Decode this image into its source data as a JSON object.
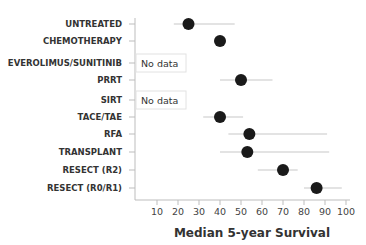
{
  "chart_data": {
    "type": "scatter",
    "subtype": "forest-plot",
    "title": "",
    "xlabel": "Median 5-year Survival",
    "ylabel": "",
    "xlim": [
      0,
      100
    ],
    "xticks": [
      10,
      20,
      30,
      40,
      50,
      60,
      70,
      80,
      90,
      100
    ],
    "grid": false,
    "legend": null,
    "categories": [
      "UNTREATED",
      "CHEMOTHERAPY",
      "EVEROLIMUS/SUNITINIB",
      "PRRT",
      "SIRT",
      "TACE/TAE",
      "RFA",
      "TRANSPLANT",
      "RESECT (R2)",
      "RESECT (R0/R1)"
    ],
    "series": [
      {
        "name": "Median 5-year Survival",
        "values": [
          25,
          40,
          null,
          50,
          null,
          40,
          54,
          53,
          70,
          86
        ],
        "ci_low": [
          18,
          null,
          null,
          40,
          null,
          32,
          44,
          40,
          58,
          80
        ],
        "ci_high": [
          47,
          null,
          null,
          65,
          null,
          51,
          91,
          92,
          77,
          98
        ]
      }
    ],
    "annotations": [
      {
        "category": "EVEROLIMUS/SUNITINIB",
        "text": "No data"
      },
      {
        "category": "SIRT",
        "text": "No data"
      }
    ]
  },
  "colors": {
    "marker": "#1a1a1a",
    "ci_line": "#c8c8c8",
    "axis": "#bdbdbd",
    "label": "#333333"
  }
}
